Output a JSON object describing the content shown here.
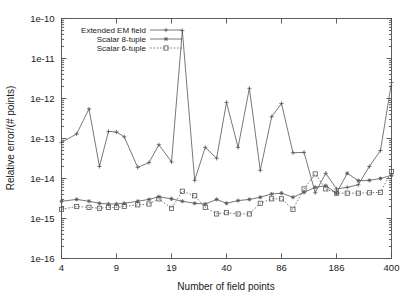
{
  "chart_data": {
    "type": "line",
    "title": "",
    "xlabel": "Number of field points",
    "ylabel": "Relative error/(# points)",
    "xscale": "log-like-index",
    "yscale": "log",
    "ylim": [
      1e-16,
      1e-10
    ],
    "ytick_labels": [
      "1e-10",
      "1e-11",
      "1e-12",
      "1e-13",
      "1e-14",
      "1e-15",
      "1e-16"
    ],
    "ytick_values": [
      1e-10,
      1e-11,
      1e-12,
      1e-13,
      1e-14,
      1e-15,
      1e-16
    ],
    "xtick_labels": [
      "4",
      "9",
      "19",
      "40",
      "86",
      "186",
      "400"
    ],
    "xtick_values": [
      4,
      9,
      19,
      40,
      86,
      186,
      400
    ],
    "grid": false,
    "legend_position": "top-left-inside",
    "x": [
      4,
      5,
      6,
      7,
      8,
      9,
      10,
      12,
      14,
      16,
      19,
      22,
      26,
      30,
      35,
      40,
      47,
      55,
      64,
      75,
      86,
      101,
      118,
      138,
      160,
      186,
      216,
      252,
      294,
      343,
      400
    ],
    "series": [
      {
        "name": "Extended EM field",
        "marker": "plus",
        "linestyle": "solid",
        "color": "#555555",
        "values": [
          8e-14,
          1.3e-13,
          5.5e-13,
          2e-14,
          1.5e-13,
          1.45e-13,
          1.1e-13,
          1.9e-14,
          2.5e-14,
          7e-14,
          2.6e-14,
          5e-11,
          9e-15,
          6e-14,
          3.2e-14,
          8e-13,
          6e-14,
          1.8e-12,
          1.6e-14,
          3.5e-13,
          7.5e-13,
          4.4e-14,
          4.5e-14,
          4.4e-15,
          1.35e-14,
          5.5e-15,
          6e-15,
          7e-15,
          2e-14,
          5e-14,
          2.5e-12
        ]
      },
      {
        "name": "Scalar 8-tuple",
        "marker": "cross-dot",
        "linestyle": "solid",
        "color": "#555555",
        "values": [
          2.7e-15,
          3e-15,
          2.7e-15,
          2.4e-15,
          2.3e-15,
          2.3e-15,
          2.4e-15,
          2.7e-15,
          3e-15,
          3.5e-15,
          3.1e-15,
          2.7e-15,
          2.4e-15,
          2.3e-15,
          3e-15,
          2.4e-15,
          2.8e-15,
          3e-15,
          3.4e-15,
          4.1e-15,
          4.3e-15,
          3.4e-15,
          4.5e-15,
          6e-15,
          6.6e-15,
          4.3e-15,
          1.35e-14,
          8.8e-15,
          9e-15,
          1e-14,
          1.2e-14
        ]
      },
      {
        "name": "Scalar 6-tuple",
        "marker": "square",
        "linestyle": "dotted",
        "color": "#555555",
        "values": [
          1.7e-15,
          2e-15,
          1.9e-15,
          1.8e-15,
          1.9e-15,
          1.9e-15,
          2e-15,
          2.2e-15,
          2.3e-15,
          3.1e-15,
          1.8e-15,
          4.8e-15,
          3.7e-15,
          1.9e-15,
          1.3e-15,
          1.4e-15,
          1.3e-15,
          1.3e-15,
          2.4e-15,
          3.1e-15,
          3.1e-15,
          1.7e-15,
          5.5e-15,
          1.3e-14,
          5.5e-15,
          4.3e-15,
          4.3e-15,
          4.3e-15,
          4.4e-15,
          4.5e-15,
          1.5e-14
        ]
      }
    ]
  }
}
